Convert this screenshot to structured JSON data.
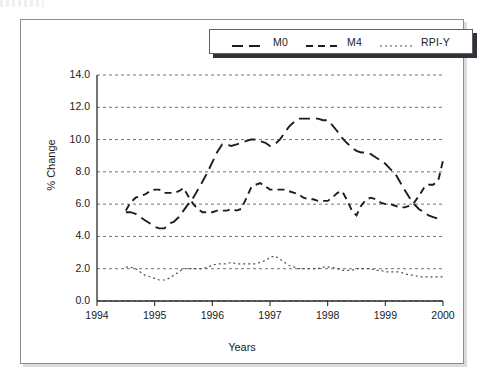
{
  "figure": {
    "ylabel": "% Change",
    "xlabel": "Years",
    "corner_artifact_name": "cropped-caption-fragment"
  },
  "legend": {
    "entries": [
      {
        "label": "M0",
        "dash": "long-dash",
        "color": "#1b1d21"
      },
      {
        "label": "M4",
        "dash": "medium-dash",
        "color": "#1b1d21"
      },
      {
        "label": "RPI-Y",
        "dash": "dotted",
        "color": "#4a4d52"
      }
    ]
  },
  "chart_data": {
    "type": "line",
    "title": "",
    "xlabel": "Years",
    "ylabel": "% Change",
    "xlim": [
      1994,
      2000
    ],
    "ylim": [
      0.0,
      14.0
    ],
    "grid": true,
    "grid_axis": "y",
    "legend_position": "top-center",
    "yticks": [
      "0.0",
      "2.0",
      "4.0",
      "6.0",
      "8.0",
      "10.0",
      "12.0",
      "14.0"
    ],
    "ytick_values": [
      0.0,
      2.0,
      4.0,
      6.0,
      8.0,
      10.0,
      12.0,
      14.0
    ],
    "xticks": [
      "1994",
      "1995",
      "1996",
      "1997",
      "1998",
      "1999",
      "2000"
    ],
    "xtick_values": [
      1994,
      1995,
      1996,
      1997,
      1998,
      1999,
      2000
    ],
    "series": [
      {
        "name": "M0",
        "dash": "long-dash",
        "color": "#1b1d21",
        "x": [
          1994.5,
          1994.58,
          1994.67,
          1994.75,
          1994.83,
          1994.92,
          1995.0,
          1995.08,
          1995.17,
          1995.25,
          1995.33,
          1995.42,
          1995.5,
          1995.58,
          1995.67,
          1995.75,
          1995.83,
          1995.92,
          1996.0,
          1996.08,
          1996.17,
          1996.25,
          1996.33,
          1996.42,
          1996.5,
          1996.58,
          1996.67,
          1996.75,
          1996.83,
          1996.92,
          1997.0,
          1997.08,
          1997.17,
          1997.25,
          1997.33,
          1997.42,
          1997.5,
          1997.58,
          1997.67,
          1997.75,
          1997.83,
          1997.92,
          1998.0,
          1998.08,
          1998.17,
          1998.25,
          1998.33,
          1998.42,
          1998.5,
          1998.58,
          1998.67,
          1998.75,
          1998.83,
          1998.92,
          1999.0,
          1999.08,
          1999.17,
          1999.25,
          1999.33,
          1999.42,
          1999.5,
          1999.58,
          1999.67,
          1999.75,
          1999.83,
          1999.92,
          2000.0
        ],
        "values": [
          5.5,
          5.5,
          5.4,
          5.2,
          5.0,
          4.8,
          4.6,
          4.5,
          4.5,
          4.8,
          4.9,
          5.2,
          5.6,
          6.0,
          6.4,
          6.9,
          7.4,
          8.0,
          8.6,
          9.2,
          9.7,
          9.7,
          9.6,
          9.7,
          9.8,
          9.9,
          10.0,
          10.0,
          9.9,
          9.8,
          9.6,
          9.7,
          10.0,
          10.4,
          10.8,
          11.1,
          11.3,
          11.3,
          11.3,
          11.3,
          11.3,
          11.2,
          11.2,
          10.9,
          10.5,
          10.1,
          9.8,
          9.5,
          9.3,
          9.2,
          9.2,
          9.1,
          8.9,
          8.7,
          8.5,
          8.2,
          7.9,
          7.4,
          6.9,
          6.4,
          6.0,
          5.7,
          5.5,
          5.3,
          5.2,
          5.1,
          5.1
        ]
      },
      {
        "name": "M4",
        "dash": "medium-dash",
        "color": "#1b1d21",
        "x": [
          1994.5,
          1994.58,
          1994.67,
          1994.75,
          1994.83,
          1994.92,
          1995.0,
          1995.08,
          1995.17,
          1995.25,
          1995.33,
          1995.42,
          1995.5,
          1995.58,
          1995.67,
          1995.75,
          1995.83,
          1995.92,
          1996.0,
          1996.08,
          1996.17,
          1996.25,
          1996.33,
          1996.42,
          1996.5,
          1996.58,
          1996.67,
          1996.75,
          1996.83,
          1996.92,
          1997.0,
          1997.08,
          1997.17,
          1997.25,
          1997.33,
          1997.42,
          1997.5,
          1997.58,
          1997.67,
          1997.75,
          1997.83,
          1997.92,
          1998.0,
          1998.08,
          1998.17,
          1998.25,
          1998.33,
          1998.42,
          1998.5,
          1998.58,
          1998.67,
          1998.75,
          1998.83,
          1998.92,
          1999.0,
          1999.08,
          1999.17,
          1999.25,
          1999.33,
          1999.42,
          1999.5,
          1999.58,
          1999.67,
          1999.75,
          1999.83,
          1999.92,
          2000.0
        ],
        "values": [
          5.6,
          6.1,
          6.4,
          6.5,
          6.6,
          6.8,
          6.9,
          6.9,
          6.7,
          6.7,
          6.7,
          6.8,
          7.0,
          6.5,
          6.0,
          5.7,
          5.5,
          5.5,
          5.5,
          5.6,
          5.6,
          5.6,
          5.7,
          5.6,
          5.7,
          6.3,
          7.0,
          7.2,
          7.3,
          7.1,
          6.9,
          6.9,
          6.9,
          6.9,
          6.8,
          6.7,
          6.6,
          6.4,
          6.3,
          6.3,
          6.2,
          6.2,
          6.2,
          6.4,
          6.7,
          6.8,
          6.3,
          5.6,
          5.3,
          5.9,
          6.3,
          6.4,
          6.3,
          6.1,
          6.0,
          6.0,
          5.9,
          5.8,
          5.8,
          5.9,
          6.1,
          6.5,
          7.0,
          7.2,
          7.2,
          7.5,
          8.7
        ]
      },
      {
        "name": "RPI-Y",
        "dash": "dotted",
        "color": "#4a4d52",
        "x": [
          1994.5,
          1994.58,
          1994.67,
          1994.75,
          1994.83,
          1994.92,
          1995.0,
          1995.08,
          1995.17,
          1995.25,
          1995.33,
          1995.42,
          1995.5,
          1995.58,
          1995.67,
          1995.75,
          1995.83,
          1995.92,
          1996.0,
          1996.08,
          1996.17,
          1996.25,
          1996.33,
          1996.42,
          1996.5,
          1996.58,
          1996.67,
          1996.75,
          1996.83,
          1996.92,
          1997.0,
          1997.08,
          1997.17,
          1997.25,
          1997.33,
          1997.42,
          1997.5,
          1997.58,
          1997.67,
          1997.75,
          1997.83,
          1997.92,
          1998.0,
          1998.08,
          1998.17,
          1998.25,
          1998.33,
          1998.42,
          1998.5,
          1998.58,
          1998.67,
          1998.75,
          1998.83,
          1998.92,
          1999.0,
          1999.08,
          1999.17,
          1999.25,
          1999.33,
          1999.42,
          1999.5,
          1999.58,
          1999.67,
          1999.75,
          1999.83,
          1999.92,
          2000.0
        ],
        "values": [
          2.1,
          2.1,
          2.0,
          1.8,
          1.6,
          1.5,
          1.4,
          1.3,
          1.3,
          1.4,
          1.6,
          1.8,
          2.0,
          2.0,
          2.0,
          2.0,
          2.0,
          2.1,
          2.2,
          2.3,
          2.3,
          2.3,
          2.4,
          2.3,
          2.3,
          2.3,
          2.3,
          2.3,
          2.4,
          2.5,
          2.7,
          2.8,
          2.6,
          2.4,
          2.2,
          2.1,
          2.0,
          2.0,
          2.0,
          2.0,
          2.0,
          2.1,
          2.1,
          2.1,
          2.0,
          1.9,
          1.9,
          1.9,
          2.0,
          2.0,
          2.0,
          2.0,
          1.9,
          1.9,
          1.8,
          1.8,
          1.8,
          1.8,
          1.7,
          1.6,
          1.6,
          1.5,
          1.5,
          1.5,
          1.5,
          1.5,
          1.5
        ]
      }
    ]
  }
}
